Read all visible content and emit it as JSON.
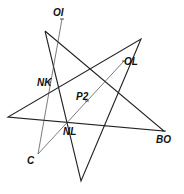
{
  "diagram": {
    "type": "geometry-figure",
    "colors": {
      "line": "#222222",
      "thin_line": "#444444",
      "label": "#111111",
      "background": "#ffffff"
    },
    "points": {
      "OI": {
        "label": "OI",
        "x": 62,
        "y": 19
      },
      "OL": {
        "label": "OL",
        "x": 124,
        "y": 61
      },
      "NK": {
        "label": "NK",
        "x": 49,
        "y": 82
      },
      "P2": {
        "label": "P2",
        "x": 87,
        "y": 101
      },
      "NL": {
        "label": "NL",
        "x": 67,
        "y": 123
      },
      "BO": {
        "label": "BO",
        "x": 164,
        "y": 131
      },
      "C": {
        "label": "C",
        "x": 38,
        "y": 154
      }
    },
    "star_vertices": [
      {
        "x": 45,
        "y": 31
      },
      {
        "x": 164,
        "y": 131
      },
      {
        "x": 8,
        "y": 117
      },
      {
        "x": 141,
        "y": 39
      },
      {
        "x": 81,
        "y": 181
      }
    ],
    "labels": {
      "OI": "OI",
      "OL": "OL",
      "NK": "NK",
      "P2": "P2",
      "NL": "NL",
      "BO": "BO",
      "C": "C"
    }
  }
}
